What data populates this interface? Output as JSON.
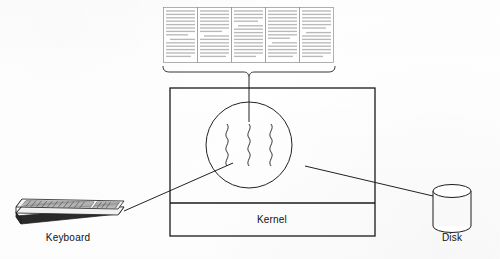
{
  "figure": {
    "type": "system-architecture-diagram",
    "background_color": "#ffffff",
    "ink_color": "#1a1a1a",
    "labels": {
      "kernel": "Kernel",
      "keyboard": "Keyboard",
      "disk": "Disk"
    },
    "user_text_block": {
      "description": "row of five narrow justified text columns representing user programs",
      "column_count": 5,
      "columns": [
        {
          "id": "col-1",
          "lines": 14
        },
        {
          "id": "col-2",
          "lines": 14
        },
        {
          "id": "col-3",
          "lines": 14
        },
        {
          "id": "col-4",
          "lines": 14
        },
        {
          "id": "col-5",
          "lines": 14
        }
      ]
    },
    "kernel_box": {
      "title": "Kernel",
      "has_inner_divider": true,
      "process_circle": {
        "squiggle_count": 3,
        "description": "circle containing three vertical wavy lines representing running processes"
      }
    },
    "devices": [
      {
        "id": "keyboard",
        "label": "Keyboard",
        "icon": "keyboard-icon",
        "side": "left"
      },
      {
        "id": "disk",
        "label": "Disk",
        "icon": "disk-cylinder-icon",
        "side": "right"
      }
    ],
    "connectors": [
      {
        "from": "user-text-block",
        "to": "process-circle",
        "style": "brace-and-line"
      },
      {
        "from": "keyboard",
        "to": "process-circle",
        "style": "straight-line"
      },
      {
        "from": "disk",
        "to": "process-circle",
        "style": "straight-line"
      }
    ]
  }
}
